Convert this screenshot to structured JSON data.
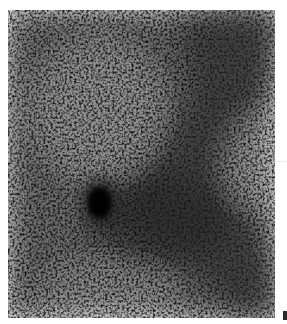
{
  "image": {
    "description": "Grainy grayscale nuclear-medicine style scan showing a dense dark focal spot on the left-center with a diffuse band of increased uptake running diagonally from upper right toward lower right",
    "colors": {
      "background": "#ffffff",
      "scan_light": "#e9e9e9",
      "scan_dark": "#111111",
      "hotspot": "#050505"
    },
    "features": [
      {
        "name": "focal-hotspot",
        "shape": "ellipse",
        "center_x": 100,
        "center_y": 203,
        "radius_x": 16,
        "radius_y": 22
      },
      {
        "name": "diagonal-uptake-band",
        "from": "upper-right",
        "to": "lower-right",
        "intensity": "moderate"
      },
      {
        "name": "upper-right-dark-region",
        "intensity": "moderate"
      }
    ],
    "panel_label": {
      "text": "",
      "visible": "partial-cropped-glyph"
    }
  }
}
